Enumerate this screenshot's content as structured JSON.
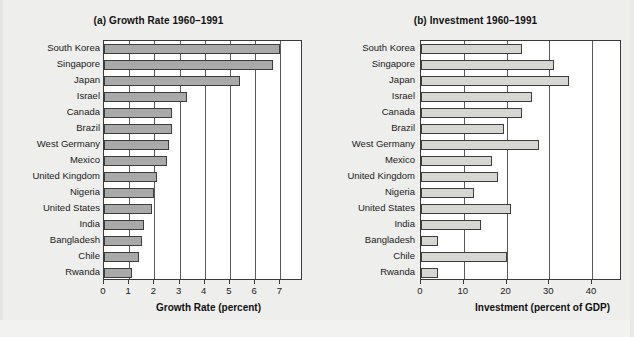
{
  "figure": {
    "background_color": "#eeeeec",
    "panels": [
      {
        "id": "growth",
        "title": "(a) Growth Rate 1960–1991",
        "axis_title": "Growth Rate (percent)",
        "bar_color": "#a9a9a9"
      },
      {
        "id": "investment",
        "title": "(b) Investment 1960–1991",
        "axis_title": "Investment (percent of GDP)",
        "bar_color": "#d6d6d2"
      }
    ]
  },
  "chart_data": [
    {
      "type": "bar",
      "orientation": "horizontal",
      "title": "(a) Growth Rate 1960–1991",
      "xlabel": "Growth Rate (percent)",
      "ylabel": "",
      "xlim": [
        0,
        7.9
      ],
      "xticks": [
        0,
        1,
        2,
        3,
        4,
        5,
        6,
        7
      ],
      "xticklabels": [
        "0",
        "1",
        "2",
        "3",
        "4",
        "5",
        "6",
        "7"
      ],
      "grid": "vertical",
      "legend": "none",
      "bar_color": "#a9a9a9",
      "categories": [
        "South Korea",
        "Singapore",
        "Japan",
        "Israel",
        "Canada",
        "Brazil",
        "West Germany",
        "Mexico",
        "United Kingdom",
        "Nigeria",
        "United States",
        "India",
        "Bangladesh",
        "Chile",
        "Rwanda"
      ],
      "values": [
        7.0,
        6.7,
        5.4,
        3.3,
        2.7,
        2.7,
        2.6,
        2.5,
        2.1,
        2.0,
        1.9,
        1.6,
        1.5,
        1.4,
        1.1
      ]
    },
    {
      "type": "bar",
      "orientation": "horizontal",
      "title": "(b) Investment 1960–1991",
      "xlabel": "Investment (percent of GDP)",
      "ylabel": "",
      "xlim": [
        0,
        47
      ],
      "xticks": [
        0,
        10,
        20,
        30,
        40
      ],
      "xticklabels": [
        "0",
        "10",
        "20",
        "30",
        "40"
      ],
      "grid": "vertical",
      "legend": "none",
      "bar_color": "#d6d6d2",
      "categories": [
        "South Korea",
        "Singapore",
        "Japan",
        "Israel",
        "Canada",
        "Brazil",
        "West Germany",
        "Mexico",
        "United Kingdom",
        "Nigeria",
        "United States",
        "India",
        "Bangladesh",
        "Chile",
        "Rwanda"
      ],
      "values": [
        23.5,
        31.0,
        34.5,
        26.0,
        23.5,
        19.5,
        27.5,
        16.5,
        18.0,
        12.5,
        21.0,
        14.0,
        4.0,
        20.0,
        4.0
      ]
    }
  ]
}
